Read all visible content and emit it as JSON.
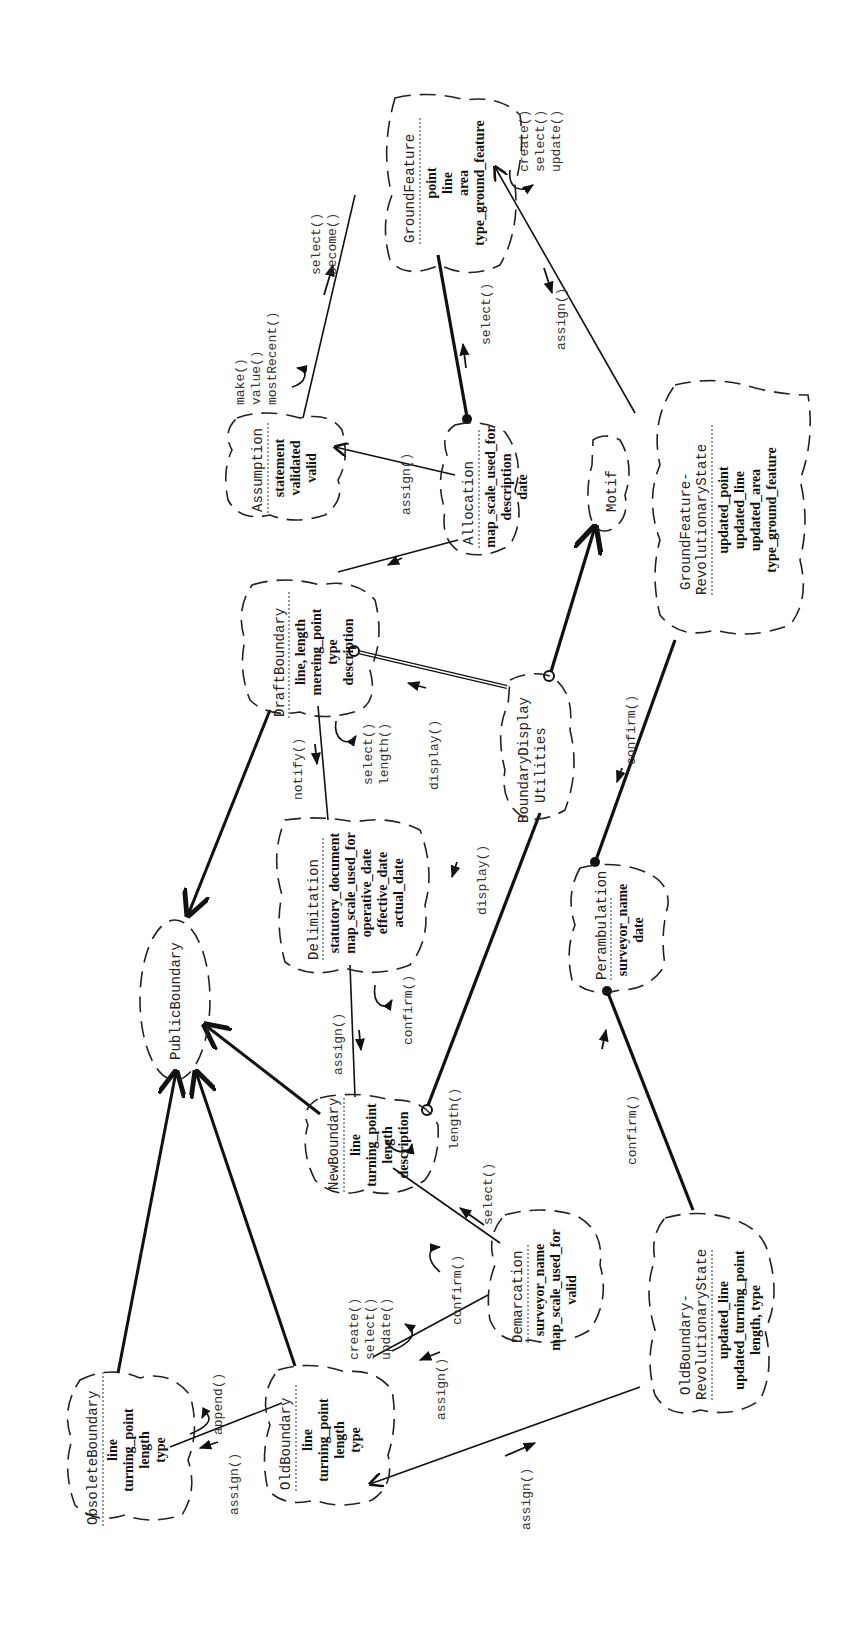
{
  "diagram": {
    "notation": "Booch class diagram (rotated 90° counter-clockwise)",
    "classes": {
      "public_boundary": {
        "name": "PublicBoundary",
        "attributes": []
      },
      "obsolete_boundary": {
        "name": "ObsoleteBoundary",
        "attributes": [
          "line",
          "turning_point",
          "length",
          "type"
        ]
      },
      "old_boundary": {
        "name": "OldBoundary",
        "attributes": [
          "line",
          "turning_point",
          "length",
          "type"
        ],
        "operations": [
          "create()",
          "select()",
          "update()"
        ]
      },
      "new_boundary": {
        "name": "NewBoundary",
        "attributes": [
          "line",
          "turning_point",
          "length",
          "description"
        ]
      },
      "delimitation": {
        "name": "Delimitation",
        "attributes": [
          "statutory_document",
          "map_scale_used_for",
          "operative_date",
          "effective_date",
          "actual_date"
        ]
      },
      "draft_boundary": {
        "name": "DraftBoundary",
        "attributes": [
          "line, length",
          "mereing_point",
          "type",
          "description"
        ],
        "operations": [
          "select()",
          "length()"
        ]
      },
      "assumption": {
        "name": "Assumption",
        "attributes": [
          "statement",
          "validated",
          "valid"
        ],
        "operations": [
          "make()",
          "value()",
          "mostRecent()"
        ]
      },
      "allocation": {
        "name": "Allocation",
        "attributes": [
          "map_scale_used_for",
          "description",
          "date"
        ]
      },
      "ground_feature": {
        "name": "GroundFeature",
        "attributes": [
          "point",
          "line",
          "area",
          "type_ground_feature"
        ],
        "operations": [
          "create()",
          "select()",
          "update()"
        ]
      },
      "boundary_display_utilities": {
        "name_line1": "BoundaryDisplay",
        "name_line2": "Utilities"
      },
      "motif": {
        "name": "Motif"
      },
      "ground_feature_rev_state": {
        "name_line1": "GroundFeature-",
        "name_line2": "RevolutionaryState",
        "attributes": [
          "updated_point",
          "updated_line",
          "updated_area",
          "type_ground_feature"
        ]
      },
      "perambulation": {
        "name": "Perambulation",
        "attributes": [
          "surveyor_name",
          "date"
        ]
      },
      "demarcation": {
        "name": "Demarcation",
        "attributes": [
          "surveyor_name",
          "map_scale_used_for",
          "valid"
        ]
      },
      "old_boundary_rev_state": {
        "name_line1": "OldBoundary-",
        "name_line2": "RevolutionaryState",
        "attributes": [
          "updated_line",
          "updated_turning_point",
          "length, type"
        ]
      }
    },
    "messages": {
      "obsolete_append": "append()",
      "old_to_obsolete_assign": "assign()",
      "old_rev_assign": "assign()",
      "demarcation_old_assign": "assign()",
      "demarcation_confirm": "confirm()",
      "new_select": "select()",
      "new_length": "length()",
      "delimitation_assign": "assign()",
      "delimitation_confirm": "confirm()",
      "draft_notify": "notify()",
      "display_draft": "display()",
      "display_new": "display()",
      "allocation_assign": "assign()",
      "gf_select_become_1": "select()",
      "gf_select_become_2": "become()",
      "gf_alloc_select": "select()",
      "gf_assign": "assign()",
      "peram_confirm_upper": "confirm()",
      "peram_confirm_lower": "confirm()"
    }
  }
}
